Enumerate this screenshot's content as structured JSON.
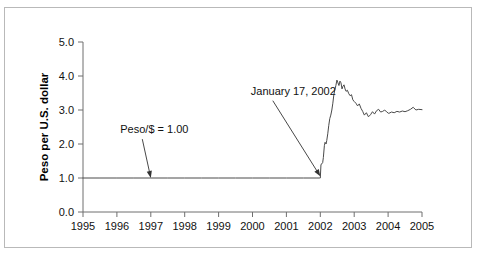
{
  "figure": {
    "border_color": "#b9b9b9",
    "background": "#ffffff"
  },
  "chart_data": {
    "type": "line",
    "title": "",
    "xlabel": "",
    "ylabel": "Peso per U.S. dollar",
    "xlim": [
      1995,
      2005
    ],
    "ylim": [
      0.0,
      5.0
    ],
    "grid": false,
    "legend": null,
    "axis_color": "#6f6f6f",
    "line_color": "#4a4a4a",
    "xticks": [
      1995,
      1996,
      1997,
      1998,
      1999,
      2000,
      2001,
      2002,
      2003,
      2004,
      2005
    ],
    "xtick_labels": [
      "1995",
      "1996",
      "1997",
      "1998",
      "1999",
      "2000",
      "2001",
      "2002",
      "2003",
      "2004",
      "2005"
    ],
    "yticks": [
      0.0,
      1.0,
      2.0,
      3.0,
      4.0,
      5.0
    ],
    "ytick_labels": [
      "0.0",
      "1.0",
      "2.0",
      "3.0",
      "4.0",
      "5.0"
    ],
    "series": [
      {
        "name": "Peso per U.S. dollar",
        "x": [
          1995.0,
          1995.5,
          1996.0,
          1996.5,
          1997.0,
          1997.5,
          1998.0,
          1998.5,
          1999.0,
          1999.5,
          2000.0,
          2000.5,
          2001.0,
          2001.5,
          2001.9,
          2001.97,
          2002.0,
          2002.02,
          2002.05,
          2002.07,
          2002.09,
          2002.12,
          2002.14,
          2002.17,
          2002.19,
          2002.22,
          2002.25,
          2002.28,
          2002.31,
          2002.34,
          2002.37,
          2002.4,
          2002.43,
          2002.46,
          2002.49,
          2002.52,
          2002.55,
          2002.58,
          2002.61,
          2002.64,
          2002.67,
          2002.7,
          2002.73,
          2002.76,
          2002.8,
          2002.84,
          2002.88,
          2002.92,
          2002.96,
          2003.0,
          2003.05,
          2003.1,
          2003.15,
          2003.2,
          2003.25,
          2003.3,
          2003.36,
          2003.42,
          2003.48,
          2003.54,
          2003.6,
          2003.66,
          2003.72,
          2003.78,
          2003.84,
          2003.9,
          2003.96,
          2004.02,
          2004.1,
          2004.18,
          2004.26,
          2004.34,
          2004.42,
          2004.5,
          2004.58,
          2004.66,
          2004.74,
          2004.82,
          2004.9,
          2005.0
        ],
        "y": [
          1.0,
          1.0,
          1.0,
          1.0,
          1.0,
          1.0,
          1.0,
          1.0,
          1.0,
          1.0,
          1.0,
          1.0,
          1.0,
          1.0,
          1.0,
          1.0,
          1.0,
          1.4,
          1.42,
          1.45,
          1.6,
          1.95,
          2.05,
          2.0,
          2.1,
          2.3,
          2.55,
          2.75,
          2.85,
          3.0,
          3.2,
          3.45,
          3.6,
          3.72,
          3.88,
          3.8,
          3.72,
          3.85,
          3.8,
          3.62,
          3.7,
          3.74,
          3.62,
          3.55,
          3.58,
          3.48,
          3.42,
          3.45,
          3.3,
          3.25,
          3.2,
          3.12,
          3.18,
          3.05,
          2.96,
          2.85,
          2.92,
          2.8,
          2.86,
          2.95,
          2.88,
          2.98,
          3.02,
          2.94,
          2.96,
          3.0,
          2.94,
          2.9,
          2.94,
          2.92,
          2.96,
          2.94,
          2.97,
          2.95,
          2.98,
          3.02,
          3.08,
          3.0,
          3.02,
          3.01
        ]
      }
    ],
    "annotations": [
      {
        "id": "peso-parity",
        "text": "Peso/$ = 1.00",
        "text_x": 1996.1,
        "text_y": 2.32,
        "point_x": 1997.0,
        "point_y": 1.0
      },
      {
        "id": "devaluation-date",
        "text": "January 17, 2002",
        "text_x": 1999.95,
        "text_y": 3.45,
        "point_x": 2002.0,
        "point_y": 1.05
      }
    ]
  }
}
